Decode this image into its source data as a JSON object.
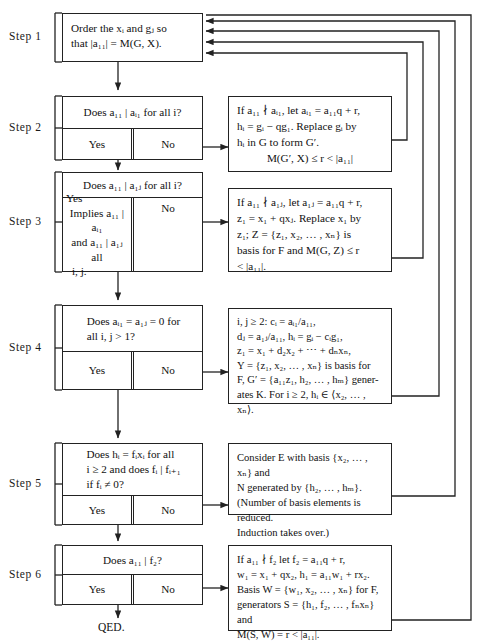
{
  "diagram": {
    "ink_color": "#222222",
    "background": "#ffffff"
  },
  "steps": [
    {
      "id": "step1",
      "label": "Step 1",
      "type": "process",
      "text": "Order the xᵢ and gⱼ so that |a₁₁| = M(G, X).",
      "text_lines": [
        "Order the xᵢ and gⱼ so",
        "that |a₁₁| = M(G, X)."
      ]
    },
    {
      "id": "step2",
      "label": "Step 2",
      "type": "decision",
      "question": "Does a₁₁ | aᵢ₁ for all i?",
      "yes_label": "Yes",
      "no_label": "No",
      "side_note_lines": [
        "If a₁₁ ∤ aᵢ₁, let aᵢ₁ = a₁₁q + r,",
        "hᵢ = gᵢ − qg₁. Replace gᵢ by",
        "hᵢ in G to form G′.",
        "M(G′, X) ≤ r < |a₁₁|"
      ]
    },
    {
      "id": "step3",
      "label": "Step 3",
      "type": "decision",
      "question": "Does a₁₁ | a₁ⱼ for all i?",
      "yes_label": "Yes",
      "yes_note_lines": [
        "Implies a₁₁ | aᵢ₁",
        "and a₁₁ | a₁ⱼ all",
        "i, j."
      ],
      "no_label": "No",
      "side_note_lines": [
        "If a₁₁ ∤ a₁ⱼ, let a₁ⱼ = a₁₁q + r,",
        "z₁ = x₁ + qxⱼ. Replace x₁ by",
        "z₁; Z = {z₁, x₂, … , xₙ} is",
        "basis for F and M(G, Z) ≤ r",
        "< |a₁₁|."
      ]
    },
    {
      "id": "step4",
      "label": "Step 4",
      "type": "decision",
      "question": "Does aᵢ₁ = a₁ⱼ = 0 for all i, j > 1?",
      "question_lines": [
        "Does aᵢ₁ = a₁ⱼ = 0 for",
        "all i, j > 1?"
      ],
      "yes_label": "Yes",
      "no_label": "No",
      "side_note_lines": [
        "i, j ≥ 2: cᵢ = aᵢ₁/a₁₁,",
        "dⱼ = a₁ⱼ/a₁₁, hᵢ = gᵢ − cᵢg₁,",
        "z₁ = x₁ + d₂x₂ + ⋯ + dₙxₙ,",
        "Y = {z₁, x₂, … , xₙ} is basis for",
        "F, G′ = {a₁₁z₁, h₂, … , hₘ} gener-",
        "ates K. For i ≥ 2, hᵢ ∈ ⟨x₂, … , xₙ⟩."
      ]
    },
    {
      "id": "step5",
      "label": "Step 5",
      "type": "decision",
      "question": "Does hᵢ = fᵢxᵢ for all i ≥ 2 and does fᵢ | fᵢ₊₁ if fᵢ ≠ 0?",
      "question_lines": [
        "Does  hᵢ = fᵢxᵢ  for  all",
        "i ≥ 2 and does fᵢ | fᵢ₊₁",
        "if fᵢ ≠ 0?"
      ],
      "yes_label": "Yes",
      "no_label": "No",
      "side_note_lines": [
        "Consider E with basis {x₂, … , xₙ} and",
        "N generated by {h₂, … , hₘ}.",
        "(Number of basis elements is reduced.",
        "Induction takes over.)"
      ]
    },
    {
      "id": "step6",
      "label": "Step 6",
      "type": "decision",
      "question": "Does a₁₁ | f₂?",
      "yes_label": "Yes",
      "no_label": "No",
      "terminal_label": "QED.",
      "side_note_lines": [
        "If a₁₁ ∤ f₂ let f₂ = a₁₁q + r,",
        "w₁ = x₁ + qx₂, h₁ = a₁₁w₁ + rx₂.",
        "Basis W = {w₁, x₂, … , xₙ} for F,",
        "generators S = {h₁, f₂, … , fₙxₙ} and",
        "M(S, W) = r < |a₁₁|."
      ]
    }
  ],
  "connectors": {
    "feedback_count": 4,
    "feedback_targets": "step1",
    "arrow_heads": [
      "down-to-step2",
      "down-to-step3",
      "down-to-step4",
      "down-to-step5",
      "down-to-step6",
      "down-to-qed",
      "right-to-note2",
      "right-to-note3",
      "right-to-note4",
      "right-to-note5",
      "right-to-note6"
    ]
  }
}
